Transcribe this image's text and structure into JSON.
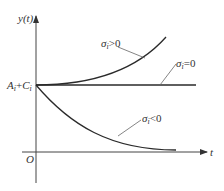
{
  "diagram": {
    "axes": {
      "y_label": "y(t)",
      "x_label": "t",
      "origin_label": "O",
      "intercept_label": "A_i+C_i"
    },
    "curves": [
      {
        "id": "growth",
        "label": "σ_i>0",
        "behavior": "exponential increase"
      },
      {
        "id": "constant",
        "label": "σ_i=0",
        "behavior": "constant"
      },
      {
        "id": "decay",
        "label": "σ_i<0",
        "behavior": "exponential decay"
      }
    ],
    "colors": {
      "line": "#2a2a2a",
      "axis": "#444444",
      "leader": "#666666"
    }
  }
}
